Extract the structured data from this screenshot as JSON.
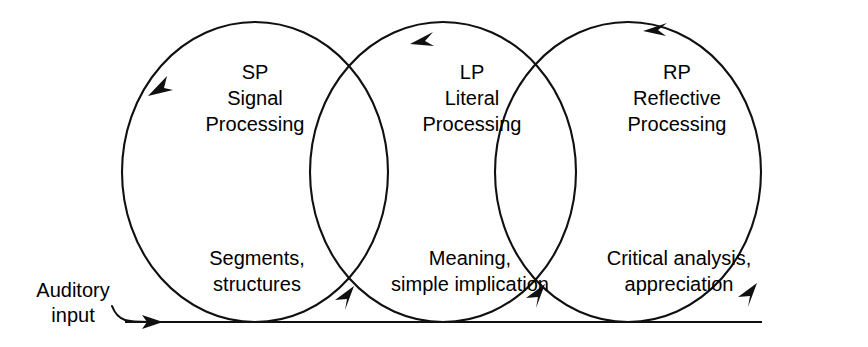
{
  "figure": {
    "type": "venn-cycle-diagram",
    "background_color": "#ffffff",
    "line_color": "#101010",
    "text_color": "#000000"
  },
  "input": {
    "label_line1": "Auditory",
    "label_line2": "input",
    "arrow_direction": "right"
  },
  "circles": [
    {
      "id": "sp",
      "abbrev": "SP",
      "name_line1": "Signal",
      "name_line2": "Processing",
      "output_line1": "Segments,",
      "output_line2": "structures",
      "cx": 255,
      "cy": 172,
      "rx": 133,
      "ry": 150,
      "arrow_rotation": "counterclockwise"
    },
    {
      "id": "lp",
      "abbrev": "LP",
      "name_line1": "Literal",
      "name_line2": "Processing",
      "output_line1": "Meaning,",
      "output_line2": "simple implication",
      "cx": 443,
      "cy": 172,
      "rx": 133,
      "ry": 150,
      "arrow_rotation": "counterclockwise"
    },
    {
      "id": "rp",
      "abbrev": "RP",
      "name_line1": "Reflective",
      "name_line2": "Processing",
      "output_line1": "Critical analysis,",
      "output_line2": "appreciation",
      "cx": 628,
      "cy": 172,
      "rx": 133,
      "ry": 150,
      "arrow_rotation": "counterclockwise"
    }
  ],
  "baseline": {
    "y": 322,
    "x_start": 125,
    "x_end": 762
  }
}
